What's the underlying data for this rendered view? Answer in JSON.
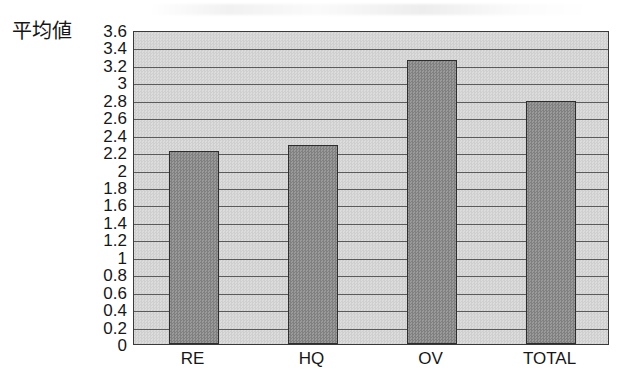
{
  "chart_data": {
    "type": "bar",
    "title": "",
    "subtitle": "",
    "xlabel": "",
    "ylabel": "平均値",
    "categories": [
      "RE",
      "HQ",
      "OV",
      "TOTAL"
    ],
    "values": [
      2.21,
      2.28,
      3.26,
      2.79
    ],
    "series": [
      {
        "name": "平均値",
        "values": [
          2.21,
          2.28,
          3.26,
          2.79
        ]
      }
    ],
    "ylim": [
      0,
      3.6
    ],
    "ytick_step": 0.2,
    "ytick_labels": [
      "3.6",
      "3.4",
      "3.2",
      "3",
      "2.8",
      "2.6",
      "2.4",
      "2.2",
      "2",
      "1.8",
      "1.6",
      "1.4",
      "1.2",
      "1",
      "0.8",
      "0.6",
      "0.4",
      "0.2",
      "0"
    ],
    "ytick_values": [
      3.6,
      3.4,
      3.2,
      3.0,
      2.8,
      2.6,
      2.4,
      2.2,
      2.0,
      1.8,
      1.6,
      1.4,
      1.2,
      1.0,
      0.8,
      0.6,
      0.4,
      0.2,
      0
    ],
    "grid": true,
    "grid_axis": "y",
    "legend": false,
    "legend_position": "none",
    "annotations": [],
    "colors": {
      "bar_fill": "#8e8e8e",
      "bar_edge": "#2e2e2e",
      "plot_background": "#d4d4d4",
      "gridline": "#4a4a4a",
      "axis_line": "#3a3a3a",
      "text": "#171717",
      "page_background": "#ffffff"
    }
  }
}
